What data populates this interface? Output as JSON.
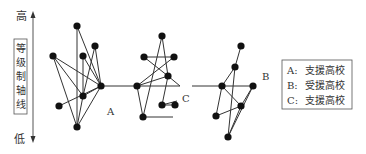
{
  "axis": {
    "high_label": "高",
    "low_label": "低",
    "title_chars": [
      "等",
      "级",
      "制",
      "轴",
      "线"
    ]
  },
  "clusters": {
    "A": {
      "label": "A"
    },
    "B": {
      "label": "B"
    },
    "C": {
      "label": "C"
    }
  },
  "legend": {
    "items": [
      {
        "key": "A:",
        "text": "支援高校"
      },
      {
        "key": "B:",
        "text": "受援高校"
      },
      {
        "key": "C:",
        "text": "支援高校"
      }
    ]
  },
  "colors": {
    "line": "#333333",
    "node": "#111111",
    "text": "#333333"
  }
}
